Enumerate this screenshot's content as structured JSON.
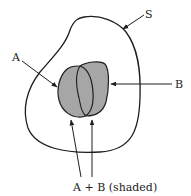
{
  "diagram": {
    "type": "venn-like set diagram",
    "colors": {
      "stroke": "#1e1e1e",
      "shade": "#a6a6a6",
      "background": "#ffffff",
      "text": "#222222"
    },
    "labels": {
      "universe": "S",
      "set_a": "A",
      "set_b": "B",
      "union": "A + B (shaded)"
    }
  }
}
